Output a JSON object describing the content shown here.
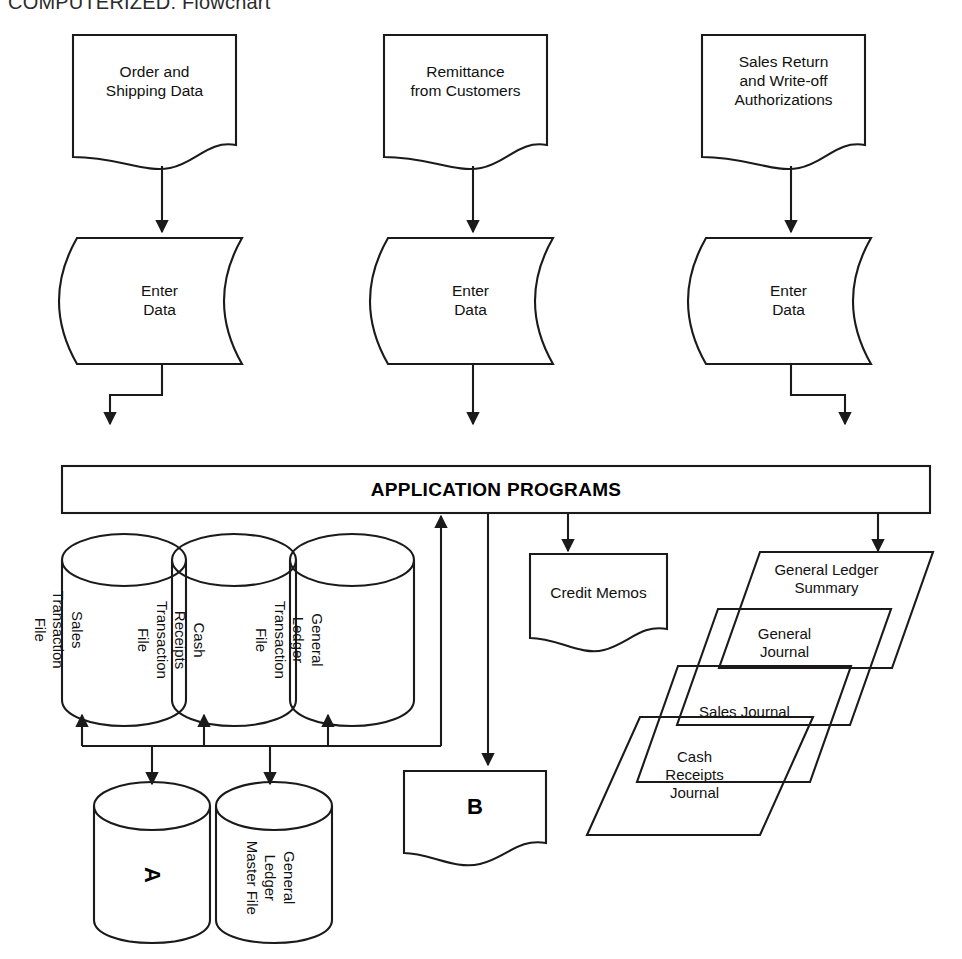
{
  "title": "COMPUTERIZED: Flowchart",
  "colors": {
    "stroke": "#1a1a1a",
    "text": "#111111",
    "background": "#ffffff"
  },
  "inputs": [
    {
      "id": "order-shipping-data",
      "label": "Order and\nShipping Data"
    },
    {
      "id": "remittance-from-customers",
      "label": "Remittance\nfrom Customers"
    },
    {
      "id": "sales-return-writeoff",
      "label": "Sales Return\nand Write-off\nAuthorizations"
    }
  ],
  "processes": [
    {
      "id": "enter-data-1",
      "label": "Enter\nData"
    },
    {
      "id": "enter-data-2",
      "label": "Enter\nData"
    },
    {
      "id": "enter-data-3",
      "label": "Enter\nData"
    }
  ],
  "application_bar": {
    "label": "APPLICATION PROGRAMS"
  },
  "transaction_files": [
    {
      "id": "sales-transaction-file",
      "label": "Sales\nTransaction\nFile"
    },
    {
      "id": "cash-receipts-transaction-file",
      "label": "Cash\nReceipts\nTransaction\nFile"
    },
    {
      "id": "general-ledger-transaction-file",
      "label": "General\nLedger\nTransaction\nFile"
    }
  ],
  "master_files": [
    {
      "id": "master-file-a",
      "label": "A"
    },
    {
      "id": "general-ledger-master-file",
      "label": "General\nLedger\nMaster File"
    }
  ],
  "documents": [
    {
      "id": "credit-memos",
      "label": "Credit Memos"
    },
    {
      "id": "connector-b",
      "label": "B"
    }
  ],
  "journals": [
    {
      "id": "general-ledger-summary",
      "label": "General Ledger\nSummary"
    },
    {
      "id": "general-journal",
      "label": "General\nJournal"
    },
    {
      "id": "sales-journal",
      "label": "Sales Journal"
    },
    {
      "id": "cash-receipts-journal",
      "label": "Cash\nReceipts\nJournal"
    }
  ]
}
